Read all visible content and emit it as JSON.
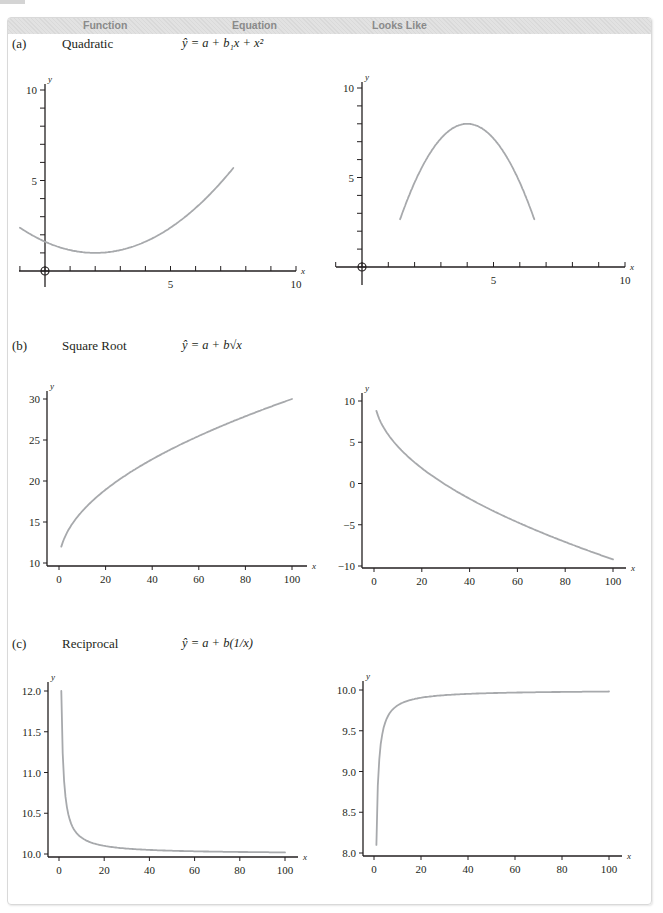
{
  "header": {
    "columns": [
      "Function",
      "Equation",
      "Looks Like"
    ]
  },
  "rows": [
    {
      "letter": "(a)",
      "name": "Quadratic",
      "equation": "ŷ = a + b₁x + x²"
    },
    {
      "letter": "(b)",
      "name": "Square Root",
      "equation": "ŷ = a + b√x"
    },
    {
      "letter": "(c)",
      "name": "Reciprocal",
      "equation": "ŷ = a + b(1/x)"
    }
  ],
  "colors": {
    "curve": "#a7a9ac",
    "axis": "#231f20",
    "header_bg": "#dedede",
    "border": "#d9d9d9",
    "header_text": "#8a8a8a"
  },
  "chart_data": [
    {
      "id": "a-left",
      "type": "line",
      "title": "Quadratic (opens upward)",
      "xlabel": "x",
      "ylabel": "y",
      "xlim": [
        -1,
        10
      ],
      "ylim": [
        -1,
        10
      ],
      "xticks": [
        5,
        10
      ],
      "yticks": [
        5,
        10
      ],
      "minor_ticks": true,
      "origin_marker": true,
      "x": [
        -1,
        0,
        1,
        2,
        3,
        4,
        5,
        6,
        7,
        7.5
      ],
      "values": [
        3.8,
        2.3,
        1.4,
        1.0,
        1.3,
        2.2,
        3.9,
        6.2,
        8.9,
        10.0
      ]
    },
    {
      "id": "a-right",
      "type": "line",
      "title": "Quadratic (opens downward)",
      "xlabel": "x",
      "ylabel": "y",
      "xlim": [
        -1,
        10
      ],
      "ylim": [
        -1,
        10
      ],
      "xticks": [
        5,
        10
      ],
      "yticks": [
        5,
        10
      ],
      "minor_ticks": true,
      "origin_marker": true,
      "x": [
        1.45,
        2,
        3,
        4,
        5,
        6,
        6.55
      ],
      "values": [
        -1.0,
        2.0,
        6.4,
        8.0,
        6.4,
        2.0,
        -1.0
      ]
    },
    {
      "id": "b-left",
      "type": "line",
      "title": "Square root (increasing)",
      "xlabel": "x",
      "ylabel": "y",
      "xlim": [
        -5,
        105
      ],
      "ylim": [
        10,
        30
      ],
      "xticks": [
        0,
        20,
        40,
        60,
        80,
        100
      ],
      "yticks": [
        10,
        15,
        20,
        25,
        30
      ],
      "x": [
        1,
        5,
        10,
        20,
        40,
        60,
        80,
        100
      ],
      "values": [
        12.0,
        14.4,
        16.3,
        18.9,
        22.9,
        25.9,
        28.1,
        30.0
      ]
    },
    {
      "id": "b-right",
      "type": "line",
      "title": "Square root (decreasing)",
      "xlabel": "x",
      "ylabel": "y",
      "xlim": [
        -5,
        105
      ],
      "ylim": [
        -10,
        10
      ],
      "xticks": [
        0,
        20,
        40,
        60,
        80,
        100
      ],
      "yticks": [
        -10,
        -5,
        0,
        5,
        10
      ],
      "x": [
        1,
        5,
        10,
        20,
        40,
        60,
        80,
        100
      ],
      "values": [
        8.7,
        6.0,
        4.1,
        1.5,
        -2.1,
        -4.8,
        -7.1,
        -9.2
      ]
    },
    {
      "id": "c-left",
      "type": "line",
      "title": "Reciprocal (decreasing)",
      "xlabel": "x",
      "ylabel": "y",
      "xlim": [
        -5,
        105
      ],
      "ylim": [
        10.0,
        12.0
      ],
      "xticks": [
        0,
        20,
        40,
        60,
        80,
        100
      ],
      "yticks": [
        10.0,
        10.5,
        11.0,
        11.5,
        12.0
      ],
      "x": [
        1,
        2,
        3,
        5,
        10,
        20,
        40,
        60,
        80,
        100
      ],
      "values": [
        12.0,
        11.0,
        10.67,
        10.4,
        10.2,
        10.1,
        10.05,
        10.03,
        10.03,
        10.02
      ]
    },
    {
      "id": "c-right",
      "type": "line",
      "title": "Reciprocal (increasing)",
      "xlabel": "x",
      "ylabel": "y",
      "xlim": [
        -5,
        105
      ],
      "ylim": [
        8.0,
        10.0
      ],
      "xticks": [
        0,
        20,
        40,
        60,
        80,
        100
      ],
      "yticks": [
        8.0,
        8.5,
        9.0,
        9.5,
        10.0
      ],
      "x": [
        1,
        2,
        3,
        5,
        10,
        20,
        40,
        60,
        80,
        100
      ],
      "values": [
        8.1,
        9.05,
        9.37,
        9.62,
        9.81,
        9.9,
        9.95,
        9.97,
        9.98,
        9.98
      ]
    }
  ]
}
